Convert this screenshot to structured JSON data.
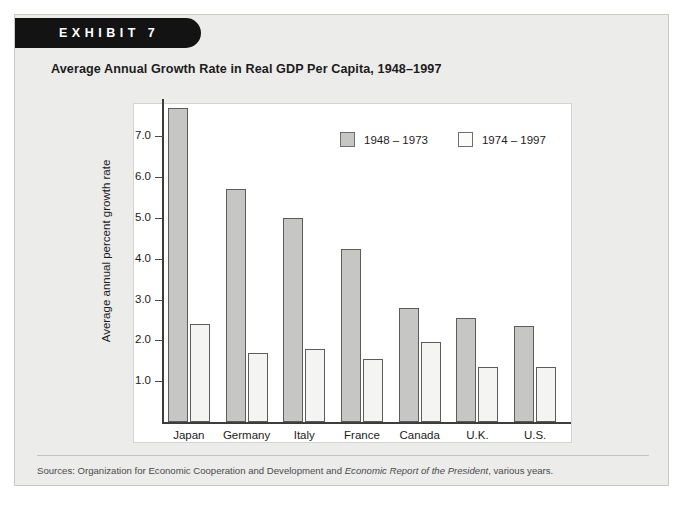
{
  "exhibit": {
    "tab_label": "EXHIBIT",
    "tab_number": "7",
    "title": "Average Annual Growth Rate in Real GDP Per Capita, 1948–1997",
    "source_prefix": "Sources: Organization for Economic Cooperation and Development and ",
    "source_italic": "Economic Report of the President",
    "source_suffix": ", various years."
  },
  "colors": {
    "series_a": "#c6c6c4",
    "series_b": "#f4f4f2",
    "bar_outline": "#5c5c5c",
    "axis": "#3d3d3d",
    "frame_bg": "#ececeb",
    "tab_bg": "#131313"
  },
  "chart_data": {
    "type": "bar",
    "title": "Average Annual Growth Rate in Real GDP Per Capita, 1948–1997",
    "xlabel": "",
    "ylabel": "Average annual percent growth rate",
    "ylim": [
      0,
      8.2
    ],
    "yticks": [
      1.0,
      2.0,
      3.0,
      4.0,
      5.0,
      6.0,
      7.0
    ],
    "ytick_labels": [
      "1.0",
      "2.0",
      "3.0",
      "4.0",
      "5.0",
      "6.0",
      "7.0"
    ],
    "grid": false,
    "legend_position": "upper-right-inside",
    "categories": [
      "Japan",
      "Germany",
      "Italy",
      "France",
      "Canada",
      "U.K.",
      "U.S."
    ],
    "series": [
      {
        "name": "1948 – 1973",
        "color": "#c6c6c4",
        "values": [
          7.7,
          5.7,
          5.0,
          4.25,
          2.8,
          2.55,
          2.35
        ]
      },
      {
        "name": "1974 – 1997",
        "color": "#f4f4f2",
        "values": [
          2.4,
          1.7,
          1.8,
          1.55,
          1.95,
          1.35,
          1.35
        ]
      }
    ]
  }
}
